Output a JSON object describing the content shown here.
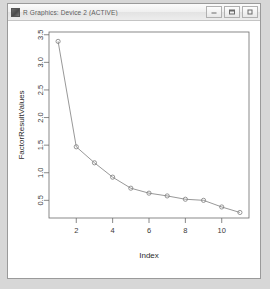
{
  "window": {
    "title": "R Graphics: Device 2 (ACTIVE)",
    "icon": "app-icon",
    "controls": [
      {
        "name": "minimize",
        "label": "Minimize"
      },
      {
        "name": "maximize",
        "label": "Maximize"
      },
      {
        "name": "close",
        "label": "Close"
      }
    ]
  },
  "chart_data": {
    "type": "line",
    "title": "",
    "xlabel": "Index",
    "ylabel": "FactorResultValues",
    "x": [
      1,
      2,
      3,
      4,
      5,
      6,
      7,
      8,
      9,
      10,
      11
    ],
    "values": [
      3.38,
      1.47,
      1.18,
      0.92,
      0.72,
      0.63,
      0.58,
      0.52,
      0.5,
      0.38,
      0.28
    ],
    "series": [
      {
        "name": "FactorResultValues",
        "values": [
          3.38,
          1.47,
          1.18,
          0.92,
          0.72,
          0.63,
          0.58,
          0.52,
          0.5,
          0.38,
          0.28
        ]
      }
    ],
    "xlim": [
      0.5,
      11.5
    ],
    "ylim": [
      0.18,
      3.55
    ],
    "xticks": [
      2,
      4,
      6,
      8,
      10
    ],
    "xtick_labels": [
      "2",
      "4",
      "6",
      "8",
      "10"
    ],
    "yticks": [
      0.5,
      1.0,
      1.5,
      2.0,
      2.5,
      3.0,
      3.5
    ],
    "ytick_labels": [
      "0.5",
      "1.0",
      "1.5",
      "2.0",
      "2.5",
      "3.0",
      "3.5"
    ],
    "grid": false,
    "legend": "none",
    "marker": "open-circle",
    "line_color": "#7d7d7d",
    "marker_color": "#7d7d7d"
  }
}
